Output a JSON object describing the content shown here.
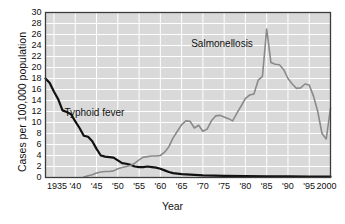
{
  "chart_data": {
    "type": "line",
    "title": "",
    "xlabel": "Year",
    "ylabel": "Cases per 100,000 population",
    "xlim": [
      1933,
      2000
    ],
    "ylim": [
      0,
      30
    ],
    "grid": true,
    "legend_position": "inline-annotations",
    "y_ticks": [
      0,
      2,
      4,
      6,
      8,
      10,
      12,
      14,
      16,
      18,
      20,
      22,
      24,
      26,
      28,
      30
    ],
    "y_tick_labels": [
      "0",
      "2",
      "4",
      "6",
      "8",
      "10",
      "12",
      "14",
      "16",
      "18",
      "20",
      "22",
      "24",
      "26",
      "28",
      "30"
    ],
    "x_ticks": [
      1935,
      1940,
      1945,
      1950,
      1955,
      1960,
      1965,
      1970,
      1975,
      1980,
      1985,
      1990,
      1995,
      2000
    ],
    "x_tick_labels": [
      "1935",
      "'40",
      "'45",
      "'50",
      "'55",
      "'60",
      "'65",
      "'70",
      "'75",
      "'80",
      "'85",
      "'90",
      "'95",
      "2000"
    ],
    "series": [
      {
        "name": "Typhoid fever",
        "color": "#111111",
        "width": 2.2,
        "x": [
          1933,
          1934,
          1935,
          1936,
          1937,
          1938,
          1939,
          1940,
          1941,
          1942,
          1943,
          1944,
          1945,
          1946,
          1947,
          1948,
          1949,
          1950,
          1951,
          1952,
          1953,
          1954,
          1955,
          1956,
          1957,
          1958,
          1959,
          1960,
          1961,
          1962,
          1963,
          1964,
          1965,
          1970,
          1975,
          1980,
          1985,
          1990,
          1995,
          2000
        ],
        "values": [
          18.0,
          17.2,
          15.6,
          14.2,
          12.2,
          11.9,
          11.5,
          10.2,
          9.0,
          7.6,
          7.4,
          6.6,
          5.2,
          4.0,
          3.8,
          3.7,
          3.6,
          3.1,
          2.6,
          2.5,
          2.3,
          2.0,
          1.9,
          1.9,
          2.0,
          1.9,
          1.8,
          1.6,
          1.3,
          1.0,
          0.8,
          0.7,
          0.6,
          0.4,
          0.3,
          0.25,
          0.2,
          0.2,
          0.18,
          0.15
        ]
      },
      {
        "name": "Salmonellosis",
        "color": "#8a8a8a",
        "width": 1.6,
        "x": [
          1942,
          1943,
          1944,
          1945,
          1946,
          1947,
          1948,
          1949,
          1950,
          1951,
          1952,
          1953,
          1954,
          1955,
          1956,
          1957,
          1958,
          1959,
          1960,
          1961,
          1962,
          1963,
          1964,
          1965,
          1966,
          1967,
          1968,
          1969,
          1970,
          1971,
          1972,
          1973,
          1974,
          1975,
          1976,
          1977,
          1978,
          1979,
          1980,
          1981,
          1982,
          1983,
          1984,
          1985,
          1986,
          1987,
          1988,
          1989,
          1990,
          1991,
          1992,
          1993,
          1994,
          1995,
          1996,
          1997,
          1998,
          1999,
          2000
        ],
        "values": [
          0.1,
          0.3,
          0.5,
          0.8,
          1.0,
          1.1,
          1.1,
          1.2,
          1.6,
          1.8,
          2.0,
          2.2,
          2.6,
          3.2,
          3.7,
          3.8,
          3.9,
          3.9,
          4.0,
          4.6,
          5.6,
          7.2,
          8.4,
          9.6,
          10.3,
          10.2,
          9.0,
          9.5,
          8.4,
          8.8,
          10.3,
          11.2,
          11.3,
          11.0,
          10.7,
          10.3,
          11.7,
          13.0,
          14.4,
          15.0,
          15.2,
          17.7,
          18.4,
          27.0,
          20.9,
          20.6,
          20.5,
          19.6,
          18.0,
          17.0,
          16.2,
          16.3,
          17.0,
          16.8,
          14.8,
          12.0,
          8.0,
          7.0,
          12.6
        ]
      }
    ],
    "annotations": [
      {
        "text": "Typhoid fever",
        "x": 1944.5,
        "y": 11.8
      },
      {
        "text": "Salmonellosis",
        "x": 1974.5,
        "y": 24.2
      }
    ]
  },
  "style": {
    "plot_bg": "#d9d9d9",
    "grid_color": "#ffffff",
    "axis_color": "#3c3c3c",
    "page_bg": "#ffffff",
    "text_color": "#111111"
  }
}
